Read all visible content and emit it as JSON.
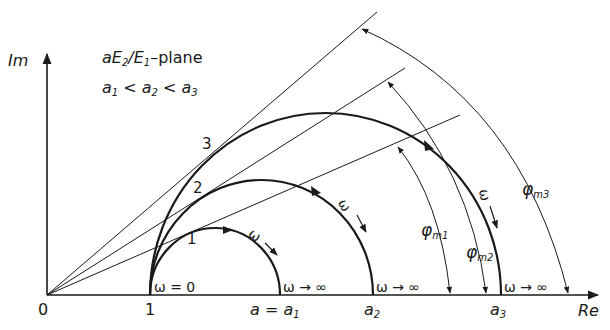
{
  "title_parts": {
    "a": "a",
    "E": "E",
    "sub2": "2",
    "slash": "/",
    "E1": "E",
    "sub1": "1",
    "suffix": "–plane"
  },
  "condition": {
    "a1": "a",
    "s1": "1",
    "lt1": " < ",
    "a2": "a",
    "s2": "2",
    "lt2": " < ",
    "a3": "a",
    "s3": "3"
  },
  "axes": {
    "y_label": "Im",
    "x_label": "Re",
    "origin": "0",
    "one": "1"
  },
  "points": {
    "a1": {
      "prefix": "a = a",
      "sub": "1"
    },
    "a2": {
      "prefix": "a",
      "sub": "2"
    },
    "a3": {
      "prefix": "a",
      "sub": "3"
    }
  },
  "curves": [
    {
      "id": "1",
      "label": "1"
    },
    {
      "id": "2",
      "label": "2"
    },
    {
      "id": "3",
      "label": "3"
    }
  ],
  "omega": {
    "zero": "ω = 0",
    "inf": "ω → ∞",
    "symbol": "ω"
  },
  "angles": [
    {
      "phi": "φ",
      "sub": "m1"
    },
    {
      "phi": "φ",
      "sub": "m2"
    },
    {
      "phi": "φ",
      "sub": "m3"
    }
  ],
  "colors": {
    "ink": "#1a1a1a",
    "background": "#ffffff"
  }
}
